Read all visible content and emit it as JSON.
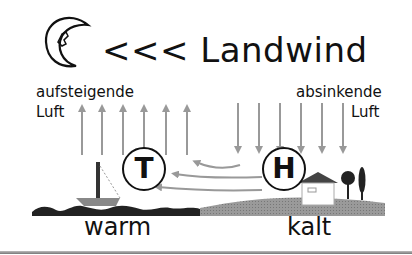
{
  "diagram": {
    "title_prefix": "<<<",
    "title": "Landwind",
    "left_label_line1": "aufsteigende",
    "left_label_line2": "Luft",
    "right_label_line1": "absinkende",
    "right_label_line2": "Luft",
    "low_pressure_symbol": "T",
    "high_pressure_symbol": "H",
    "left_zone_label": "warm",
    "right_zone_label": "kalt",
    "icons": {
      "moon": "crescent-moon-icon",
      "rising_arrows": 6,
      "sinking_arrows": 6,
      "return_flow_arrows": 3
    },
    "colors": {
      "text": "#111111",
      "arrow": "#999999",
      "sea": "#222222",
      "land": "#9a9a9a"
    }
  }
}
